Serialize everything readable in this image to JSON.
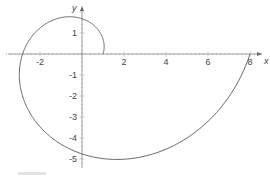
{
  "chart_data": {
    "type": "line",
    "title": "",
    "xlabel": "x",
    "ylabel": "y",
    "x_ticks": [
      -2,
      2,
      4,
      6,
      8
    ],
    "y_ticks": [
      1,
      -1,
      -2,
      -3,
      -4,
      -5
    ],
    "xlim": [
      -3.8,
      8.8
    ],
    "ylim": [
      -5.3,
      2.5
    ],
    "grid": false,
    "legend": null,
    "series": [
      {
        "name": "spiral",
        "points": [
          [
            1.0,
            0.0
          ],
          [
            0.82,
            0.92
          ],
          [
            0.0,
            1.68
          ],
          [
            -1.5,
            1.5
          ],
          [
            -2.83,
            0.0
          ],
          [
            -2.5,
            -2.5
          ],
          [
            0.0,
            -4.75
          ],
          [
            1.7,
            -5.0
          ],
          [
            4.5,
            -4.0
          ],
          [
            8.0,
            0.0
          ]
        ]
      }
    ]
  },
  "axes": {
    "x_label": "x",
    "y_label": "y"
  },
  "caption": ""
}
